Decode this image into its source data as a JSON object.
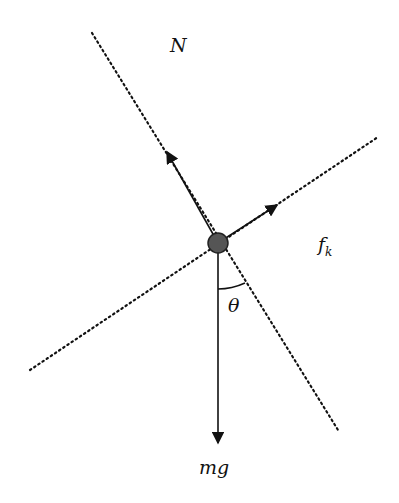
{
  "diagram": {
    "labels": {
      "normal": "N",
      "friction": "f",
      "friction_sub": "k",
      "weight": "mg",
      "angle": "θ"
    },
    "colors": {
      "line": "#111111",
      "ball": "#555555"
    }
  }
}
